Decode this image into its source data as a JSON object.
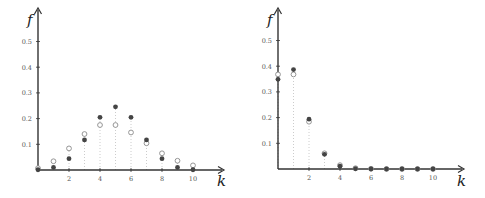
{
  "chart_data": [
    {
      "type": "scatter",
      "title": "",
      "xlabel": "k",
      "ylabel": "f",
      "x_ticks": [
        2,
        4,
        6,
        8,
        10
      ],
      "y_ticks": [
        "0.1",
        "0.2",
        "0.3",
        "0.4",
        "0.5"
      ],
      "xlim": [
        0,
        11.5
      ],
      "ylim": [
        0,
        0.6
      ],
      "grid": false,
      "legend": null,
      "x": [
        0,
        1,
        2,
        3,
        4,
        5,
        6,
        7,
        8,
        9,
        10
      ],
      "series": [
        {
          "name": "filled",
          "style": "filled-dot",
          "values": [
            0.001,
            0.01,
            0.044,
            0.117,
            0.205,
            0.246,
            0.205,
            0.117,
            0.044,
            0.01,
            0.001
          ]
        },
        {
          "name": "open",
          "style": "open-circle",
          "values": [
            0.007,
            0.034,
            0.084,
            0.14,
            0.175,
            0.175,
            0.146,
            0.104,
            0.065,
            0.036,
            0.018
          ]
        }
      ]
    },
    {
      "type": "scatter",
      "title": "",
      "xlabel": "k",
      "ylabel": "f",
      "x_ticks": [
        2,
        4,
        6,
        8,
        10
      ],
      "y_ticks": [
        "0.1",
        "0.2",
        "0.3",
        "0.4",
        "0.5"
      ],
      "xlim": [
        0,
        11.5
      ],
      "ylim": [
        0,
        0.6
      ],
      "grid": false,
      "legend": null,
      "x": [
        0,
        1,
        2,
        3,
        4,
        5,
        6,
        7,
        8,
        9,
        10
      ],
      "series": [
        {
          "name": "filled",
          "style": "filled-dot",
          "values": [
            0.349,
            0.387,
            0.194,
            0.057,
            0.011,
            0.001,
            0.0,
            0.0,
            0.0,
            0.0,
            0.0
          ]
        },
        {
          "name": "open",
          "style": "open-circle",
          "values": [
            0.368,
            0.368,
            0.184,
            0.061,
            0.015,
            0.003,
            0.001,
            0.0,
            0.0,
            0.0,
            0.0
          ]
        }
      ]
    }
  ],
  "colors": {
    "axis": "#333333",
    "filled": "#444444",
    "open": "#8a8a8a",
    "stem": "#cccccc",
    "tick_label": "#555555"
  },
  "layout": [
    {
      "x0": 38,
      "y0": 170,
      "px_per_unit_x": 15.5,
      "px_per_unit_y": 257,
      "axis_end_x": 224,
      "axis_top_y": 8
    },
    {
      "x0": 278,
      "y0": 169,
      "px_per_unit_x": 15.5,
      "px_per_unit_y": 257,
      "axis_end_x": 464,
      "axis_top_y": 8
    }
  ]
}
